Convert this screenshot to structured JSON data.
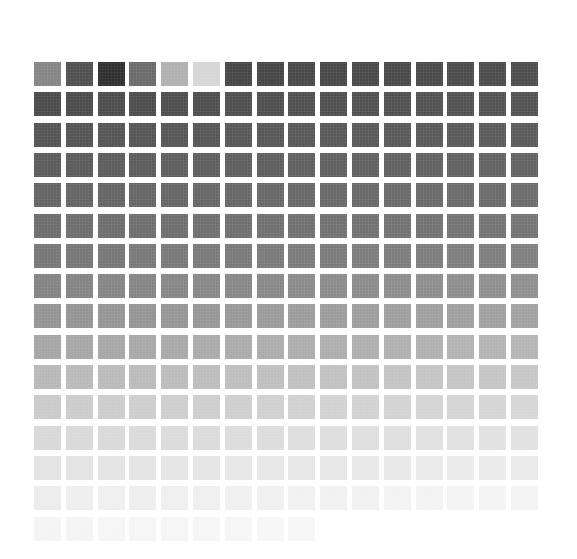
{
  "grid": {
    "columns": 16,
    "rows": 16,
    "origin": [
      34,
      62
    ],
    "cell_size": [
      27,
      24
    ],
    "pitch": [
      31.8,
      30.3
    ],
    "row_colors": [
      [
        "#858585",
        "#4f4f4f",
        "#2e2e2e",
        "#6a6a6a",
        "#b0b0b0",
        "#d6d6d6",
        "#454545",
        "#454545",
        "#474747",
        "#474747",
        "#484848",
        "#484848",
        "#494949",
        "#4a4a4a",
        "#4b4b4b",
        "#4c4c4c"
      ],
      [
        "#4a4a4a",
        "#4b4b4b",
        "#4c4c4c",
        "#4c4c4c",
        "#4d4d4d",
        "#4d4d4d",
        "#4e4e4e",
        "#4e4e4e",
        "#4f4f4f",
        "#4f4f4f",
        "#505050",
        "#505050",
        "#515151",
        "#515151",
        "#525252",
        "#525252"
      ],
      [
        "#535353",
        "#535353",
        "#545454",
        "#545454",
        "#555555",
        "#555555",
        "#565656",
        "#565656",
        "#575757",
        "#575757",
        "#585858",
        "#585858",
        "#595959",
        "#595959",
        "#5a5a5a",
        "#5a5a5a"
      ],
      [
        "#5b5b5b",
        "#5b5b5b",
        "#5c5c5c",
        "#5c5c5c",
        "#5d5d5d",
        "#5d5d5d",
        "#5e5e5e",
        "#5e5e5e",
        "#5f5f5f",
        "#5f5f5f",
        "#606060",
        "#606060",
        "#616161",
        "#616161",
        "#626262",
        "#626262"
      ],
      [
        "#636363",
        "#646464",
        "#646464",
        "#656565",
        "#656565",
        "#666666",
        "#666666",
        "#676767",
        "#676767",
        "#686868",
        "#686868",
        "#696969",
        "#696969",
        "#6a6a6a",
        "#6a6a6a",
        "#6b6b6b"
      ],
      [
        "#6c6c6c",
        "#6d6d6d",
        "#6d6d6d",
        "#6e6e6e",
        "#6e6e6e",
        "#6f6f6f",
        "#6f6f6f",
        "#707070",
        "#707070",
        "#717171",
        "#717171",
        "#727272",
        "#727272",
        "#737373",
        "#737373",
        "#747474"
      ],
      [
        "#767676",
        "#777777",
        "#777777",
        "#787878",
        "#787878",
        "#797979",
        "#797979",
        "#7a7a7a",
        "#7b7b7b",
        "#7b7b7b",
        "#7c7c7c",
        "#7c7c7c",
        "#7d7d7d",
        "#7e7e7e",
        "#7e7e7e",
        "#7f7f7f"
      ],
      [
        "#838383",
        "#848484",
        "#858585",
        "#858585",
        "#868686",
        "#878787",
        "#878787",
        "#888888",
        "#8a8a8a",
        "#8b8b8b",
        "#8b8b8b",
        "#8c8c8c",
        "#8d8d8d",
        "#8d8d8d",
        "#8e8e8e",
        "#8f8f8f"
      ],
      [
        "#939393",
        "#949494",
        "#959595",
        "#959595",
        "#969696",
        "#979797",
        "#989898",
        "#9b9b9b",
        "#9c9c9c",
        "#9c9c9c",
        "#9d9d9d",
        "#9e9e9e",
        "#9f9f9f",
        "#9f9f9f",
        "#a0a0a0",
        "#a1a1a1"
      ],
      [
        "#a5a5a5",
        "#a6a6a6",
        "#a7a7a7",
        "#a8a8a8",
        "#a9a9a9",
        "#aaaaaa",
        "#ababab",
        "#acacac",
        "#adadad",
        "#aeaeae",
        "#afafaf",
        "#b0b0b0",
        "#b1b1b1",
        "#b2b2b2",
        "#b3b3b3",
        "#b4b4b4"
      ],
      [
        "#b8b8b8",
        "#b9b9b9",
        "#bababa",
        "#bbbbbb",
        "#bcbcbc",
        "#bdbdbd",
        "#bebebe",
        "#bfbfbf",
        "#c0c0c0",
        "#c1c1c1",
        "#c2c2c2",
        "#c3c3c3",
        "#c4c4c4",
        "#c4c4c4",
        "#c5c5c5",
        "#c6c6c6"
      ],
      [
        "#cacaca",
        "#cbcbcb",
        "#cccccc",
        "#cdcdcd",
        "#cecece",
        "#cecece",
        "#cfcfcf",
        "#d0d0d0",
        "#d1d1d1",
        "#d2d2d2",
        "#d2d2d2",
        "#d3d3d3",
        "#d4d4d4",
        "#d4d4d4",
        "#d5d5d5",
        "#d6d6d6"
      ],
      [
        "#d8d8d8",
        "#d9d9d9",
        "#d9d9d9",
        "#dadada",
        "#dbdbdb",
        "#dbdbdb",
        "#dcdcdc",
        "#dcdcdc",
        "#dedede",
        "#dedede",
        "#dfdfdf",
        "#dfdfdf",
        "#e0e0e0",
        "#e0e0e0",
        "#e1e1e1",
        "#e1e1e1"
      ],
      [
        "#e3e3e3",
        "#e3e3e3",
        "#e4e4e4",
        "#e4e4e4",
        "#e5e5e5",
        "#e5e5e5",
        "#e6e6e6",
        "#e6e6e6",
        "#e7e7e7",
        "#e7e7e7",
        "#e8e8e8",
        "#e8e8e8",
        "#e9e9e9",
        "#e9e9e9",
        "#eaeaea",
        "#eaeaea"
      ],
      [
        "#ececec",
        "#eeeeee",
        "#efefef",
        "#eeeeee",
        "#efefef",
        "#efefef",
        "#f0f0f0",
        "#f0f0f0",
        "#f1f1f1",
        "#f1f1f1",
        "#f1f1f1",
        "#f2f2f2",
        "#f2f2f2",
        "#f3f3f3",
        "#f3f3f3",
        "#f3f3f3"
      ],
      [
        "#f4f4f4",
        "#f4f4f4",
        "#f5f5f5",
        "#f5f5f5",
        "#f5f5f5",
        "#f6f6f6",
        "#f6f6f6",
        "#f7f7f7",
        "#f7f7f7"
      ]
    ]
  }
}
